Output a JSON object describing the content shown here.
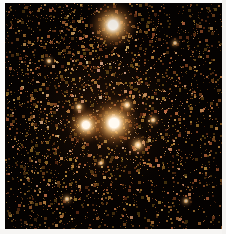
{
  "figure": {
    "kind": "astronomical-star-field-image",
    "caption": "",
    "width": 226,
    "height": 234
  },
  "frame": {
    "field_x": 5,
    "field_y": 3,
    "field_width": 217,
    "field_height": 226,
    "background_color": "#050201",
    "border_color": "#f4f3f1"
  },
  "palette": {
    "background": "#050201",
    "faint_star": "#5c3418",
    "mid_star": "#b4702f",
    "bright_star": "#f0b872",
    "hot_core": "#fffaf2",
    "nebulosity": "#3a1f0c"
  },
  "chart_data": {
    "type": "scatter",
    "title": "",
    "xlabel": "",
    "ylabel": "",
    "grid": false,
    "legend": null,
    "xlim": [
      0,
      217
    ],
    "ylim": [
      0,
      226
    ],
    "note": "Dense resolved star field; coordinates are pixel offsets inside the dark frame.",
    "bright_stars": [
      {
        "id": "star-A",
        "x": 108,
        "y": 22,
        "radius": 9.0,
        "peak": 1.0,
        "color": "#fffaf2",
        "label": "top bright star"
      },
      {
        "id": "star-B",
        "x": 109,
        "y": 120,
        "radius": 9.5,
        "peak": 1.0,
        "color": "#fffaf2",
        "label": "central brightest star"
      },
      {
        "id": "star-C",
        "x": 81,
        "y": 122,
        "radius": 7.0,
        "peak": 0.92,
        "color": "#fff6e8",
        "label": "central companion star"
      },
      {
        "id": "star-D",
        "x": 133,
        "y": 142,
        "radius": 4.2,
        "peak": 0.62,
        "color": "#f3c98f",
        "label": "lower mid star"
      },
      {
        "id": "star-E",
        "x": 122,
        "y": 102,
        "radius": 3.6,
        "peak": 0.55,
        "color": "#eec188",
        "label": "upper mid star"
      },
      {
        "id": "star-F",
        "x": 74,
        "y": 104,
        "radius": 3.2,
        "peak": 0.5,
        "color": "#e8ba80",
        "label": "left mid star"
      },
      {
        "id": "star-G",
        "x": 148,
        "y": 117,
        "radius": 3.0,
        "peak": 0.46,
        "color": "#e2b175",
        "label": "right mid star"
      },
      {
        "id": "star-H",
        "x": 62,
        "y": 196,
        "radius": 2.8,
        "peak": 0.42,
        "color": "#dfac70",
        "label": "lower left star"
      },
      {
        "id": "star-I",
        "x": 181,
        "y": 198,
        "radius": 2.6,
        "peak": 0.4,
        "color": "#dba868",
        "label": "lower right star"
      },
      {
        "id": "star-J",
        "x": 44,
        "y": 58,
        "radius": 2.6,
        "peak": 0.4,
        "color": "#dba868",
        "label": "upper left star"
      },
      {
        "id": "star-K",
        "x": 170,
        "y": 40,
        "radius": 2.4,
        "peak": 0.38,
        "color": "#d6a265",
        "label": "upper right star"
      },
      {
        "id": "star-L",
        "x": 96,
        "y": 160,
        "radius": 2.4,
        "peak": 0.36,
        "color": "#d29d62",
        "label": "below center star"
      }
    ],
    "field_population": {
      "point_count": 5200,
      "radius_range": [
        0.5,
        2.2
      ],
      "brightness_range": [
        0.1,
        0.8
      ],
      "hue_range_deg": [
        18,
        40
      ],
      "density_profile": "cluster-concentrated toward upper-left of centre, sparser lower-right"
    },
    "glow_halo": {
      "center_x": 100,
      "center_y": 112,
      "radius": 96,
      "color": "#2a1508",
      "opacity": 0.55
    }
  }
}
